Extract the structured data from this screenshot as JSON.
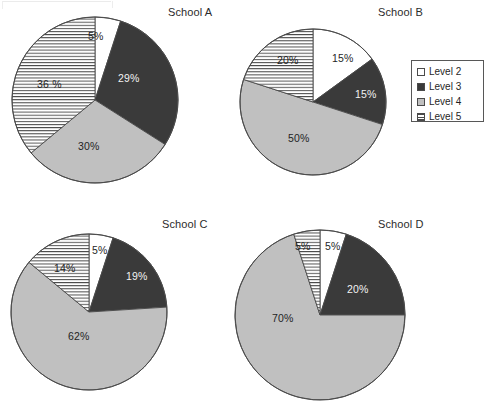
{
  "figure": {
    "title": "",
    "colors": {
      "level2": "#ffffff",
      "level3": "#3a3a3a",
      "level4": "#c0c0c0",
      "level5": "#ffffff",
      "stripe": "#4a4a4a",
      "outline": "#4a4a4a",
      "background": "#ffffff"
    }
  },
  "legend": {
    "name": "legend-box",
    "position": "right-top",
    "items": [
      {
        "label": "Level 2",
        "swatch": "white",
        "color": "#ffffff"
      },
      {
        "label": "Level 3",
        "swatch": "dark",
        "color": "#3a3a3a"
      },
      {
        "label": "Level 4",
        "swatch": "gray",
        "color": "#c0c0c0"
      },
      {
        "label": "Level 5",
        "swatch": "striped",
        "color": "#ffffff"
      }
    ]
  },
  "chart_data": [
    {
      "type": "pie",
      "title": "School A",
      "labels": [
        "Level 2",
        "Level 3",
        "Level 4",
        "Level 5"
      ],
      "values": [
        5,
        29,
        30,
        36
      ],
      "data_labels": [
        "5%",
        "29%",
        "30%",
        "36 %"
      ],
      "start_angle": 90,
      "direction": "clockwise",
      "center": [
        95,
        100
      ],
      "radius": 83
    },
    {
      "type": "pie",
      "title": "School B",
      "labels": [
        "Level 2",
        "Level 3",
        "Level 4",
        "Level 5"
      ],
      "values": [
        15,
        15,
        50,
        20
      ],
      "data_labels": [
        "15%",
        "15%",
        "50%",
        "20%"
      ],
      "start_angle": 90,
      "direction": "clockwise",
      "center": [
        313,
        102
      ],
      "radius": 73
    },
    {
      "type": "pie",
      "title": "School C",
      "labels": [
        "Level 2",
        "Level 3",
        "Level 4",
        "Level 5"
      ],
      "values": [
        5,
        19,
        62,
        14
      ],
      "data_labels": [
        "5%",
        "19%",
        "62%",
        "14%"
      ],
      "start_angle": 90,
      "direction": "clockwise",
      "center": [
        89,
        312
      ],
      "radius": 78
    },
    {
      "type": "pie",
      "title": "School D",
      "labels": [
        "Level 2",
        "Level 3",
        "Level 4",
        "Level 5"
      ],
      "values": [
        5,
        20,
        70,
        5
      ],
      "data_labels": [
        "5%",
        "20%",
        "70%",
        "5%"
      ],
      "start_angle": 90,
      "direction": "clockwise",
      "center": [
        320,
        315
      ],
      "radius": 85
    }
  ],
  "titles": {
    "a": "School A",
    "b": "School B",
    "c": "School C",
    "d": "School D"
  },
  "labels": {
    "a": {
      "l2": "5%",
      "l3": "29%",
      "l4": "30%",
      "l5": "36 %"
    },
    "b": {
      "l2": "15%",
      "l3": "15%",
      "l4": "50%",
      "l5": "20%"
    },
    "c": {
      "l2": "5%",
      "l3": "19%",
      "l4": "62%",
      "l5": "14%"
    },
    "d": {
      "l2": "5%",
      "l3": "20%",
      "l4": "70%",
      "l5": "5%"
    }
  }
}
